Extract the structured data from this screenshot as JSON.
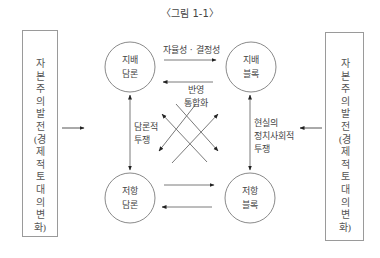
{
  "caption": "〈그림 1-1〉",
  "side_boxes": {
    "left": {
      "text": "자본주의발전(경제적토대의변화)",
      "lines": [
        "자",
        "본",
        "주",
        "의",
        " ",
        "발",
        "전",
        "(",
        "경",
        "제",
        "적",
        " ",
        "토",
        "대",
        "의",
        " ",
        "변",
        "화",
        ")"
      ]
    },
    "right": {
      "text": "자본주의발전(경제적토대의변화)"
    }
  },
  "nodes": {
    "dominant_discourse": {
      "line1": "지배",
      "line2": "담론"
    },
    "dominant_bloc": {
      "line1": "지배",
      "line2": "블록"
    },
    "resistance_discourse": {
      "line1": "저항",
      "line2": "담론"
    },
    "resistance_bloc": {
      "line1": "저항",
      "line2": "블록"
    }
  },
  "edge_labels": {
    "top_forward": "자율성 · 결정성",
    "top_backward_line1": "반영",
    "top_backward_line2": "통합화",
    "left_vertical_line1": "담론적",
    "left_vertical_line2": "투쟁",
    "right_vertical_line1": "현실의",
    "right_vertical_line2": "정치사회적",
    "right_vertical_line3": "투쟁"
  },
  "colors": {
    "line": "#7a7a7a",
    "arrow": "#222222",
    "box_border": "#9a9a9a",
    "circle_border": "#8a8a8a"
  }
}
